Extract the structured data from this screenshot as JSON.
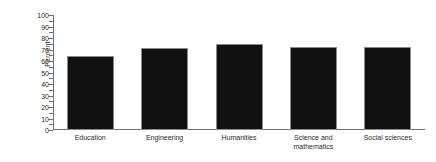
{
  "chart_data": {
    "type": "bar",
    "title": "",
    "subtitle": "",
    "xlabel": "",
    "ylabel": "Percent",
    "ylim": [
      0,
      100
    ],
    "ytick_step": 10,
    "grid": false,
    "legend": false,
    "legend_position": "none",
    "orientation": "vertical",
    "bar_color": "#111111",
    "bar_edge_color": "#8a8a8a",
    "axis_color": "#6e6e6e",
    "background_color": "#ffffff",
    "text_color": "#2b2b2b",
    "categories": [
      "Education",
      "Engineering",
      "Humanities",
      "Science and\nmathematics",
      "Social sciences"
    ],
    "values": [
      64,
      71,
      75,
      72,
      72
    ],
    "ytick_labels": [
      "100",
      "90",
      "80",
      "70",
      "60",
      "50",
      "40",
      "30",
      "20",
      "10",
      "0"
    ],
    "ytick_values": [
      100,
      90,
      80,
      70,
      60,
      50,
      40,
      30,
      20,
      10,
      0
    ]
  }
}
